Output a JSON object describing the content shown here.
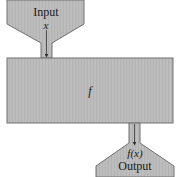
{
  "diagram": {
    "type": "function-machine",
    "input": {
      "label": "Input",
      "variable": "x"
    },
    "machine": {
      "label": "f"
    },
    "output": {
      "variable": "f(x)",
      "label": "Output"
    },
    "colors": {
      "fill": "#b9b9b9",
      "stroke": "#6e6e6e",
      "arrow": "#222222",
      "background": "#ffffff"
    }
  }
}
